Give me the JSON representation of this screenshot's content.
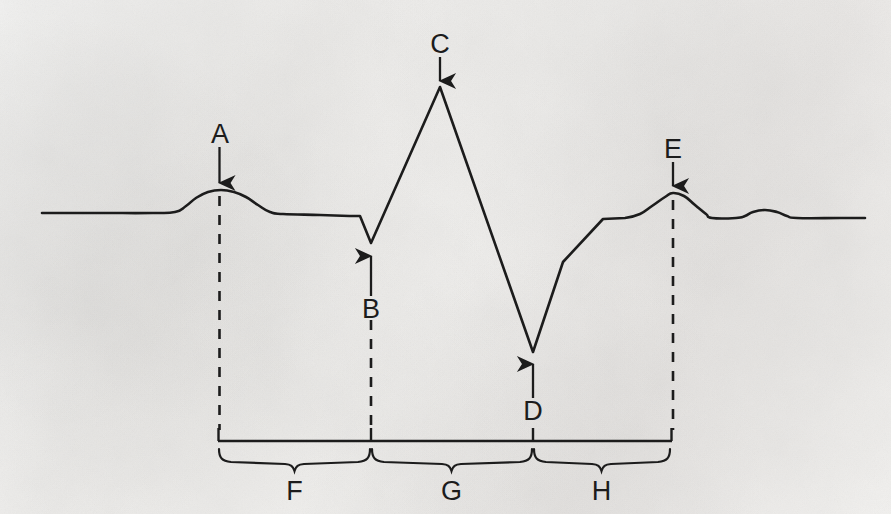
{
  "figure": {
    "kind": "ecg-waveform-labeled-diagram",
    "background_color": "#f3f2f0",
    "ink_color": "#1c1c1c",
    "width": 891,
    "height": 514
  },
  "labels": {
    "a": "A",
    "b": "B",
    "c": "C",
    "d": "D",
    "e": "E",
    "f": "F",
    "g": "G",
    "h": "H"
  },
  "chart_data": {
    "type": "line",
    "title": "",
    "xlabel": "",
    "ylabel": "",
    "grid": false,
    "legend": null,
    "series": [
      {
        "name": "ecg-trace",
        "points": [
          [
            42,
            213
          ],
          [
            100,
            213
          ],
          [
            152,
            213
          ],
          [
            175,
            212
          ],
          [
            186,
            206
          ],
          [
            196,
            198
          ],
          [
            208,
            192
          ],
          [
            221,
            190
          ],
          [
            234,
            192
          ],
          [
            246,
            197
          ],
          [
            258,
            205
          ],
          [
            270,
            212
          ],
          [
            283,
            214
          ],
          [
            320,
            215
          ],
          [
            352,
            216
          ],
          [
            360,
            216
          ],
          [
            371,
            243
          ],
          [
            440,
            87
          ],
          [
            533,
            352
          ],
          [
            563,
            262
          ],
          [
            603,
            219
          ],
          [
            625,
            218
          ],
          [
            640,
            214
          ],
          [
            652,
            206
          ],
          [
            665,
            197
          ],
          [
            673,
            193
          ],
          [
            684,
            196
          ],
          [
            695,
            205
          ],
          [
            706,
            214
          ],
          [
            712,
            218
          ],
          [
            736,
            218
          ],
          [
            745,
            216
          ],
          [
            753,
            212
          ],
          [
            765,
            210
          ],
          [
            777,
            212
          ],
          [
            787,
            216
          ],
          [
            797,
            218
          ],
          [
            840,
            218
          ],
          [
            865,
            218
          ]
        ]
      }
    ],
    "annotations": [
      {
        "label": "A",
        "kind": "down-arrow-with-dashed-dropline",
        "label_x": 220,
        "label_y": 133,
        "arrow_from_y": 147,
        "arrow_to_y": 186,
        "target_x": 220,
        "target_y": 190,
        "dash_from_y": 196,
        "dash_to_y": 430
      },
      {
        "label": "B",
        "kind": "up-arrow-with-dashed-dropline",
        "label_x": 371,
        "label_y": 311,
        "arrow_from_y": 296,
        "arrow_to_y": 252,
        "target_x": 371,
        "target_y": 243,
        "dash_from_y": 320,
        "dash_to_y": 430
      },
      {
        "label": "C",
        "kind": "down-arrow",
        "label_x": 440,
        "label_y": 47,
        "arrow_from_y": 57,
        "arrow_to_y": 84,
        "target_x": 440,
        "target_y": 87
      },
      {
        "label": "D",
        "kind": "up-arrow",
        "label_x": 533,
        "label_y": 413,
        "arrow_from_y": 398,
        "arrow_to_y": 360,
        "target_x": 533,
        "target_y": 352
      },
      {
        "label": "E",
        "kind": "down-arrow-with-dashed-dropline",
        "label_x": 673,
        "label_y": 152,
        "arrow_from_y": 162,
        "arrow_to_y": 189,
        "target_x": 673,
        "target_y": 193,
        "dash_from_y": 200,
        "dash_to_y": 430
      },
      {
        "label": "F",
        "kind": "interval-brace",
        "from_x": 218,
        "to_x": 371,
        "label_x": 294,
        "label_y": 494
      },
      {
        "label": "G",
        "kind": "interval-brace",
        "from_x": 371,
        "to_x": 533,
        "label_x": 452,
        "label_y": 494
      },
      {
        "label": "H",
        "kind": "interval-brace",
        "from_x": 533,
        "to_x": 672,
        "label_x": 602,
        "label_y": 494
      }
    ],
    "axis_bar": {
      "from_x": 218,
      "to_x": 672,
      "y": 441,
      "tick_top_y": 428,
      "ticks_x": [
        218,
        371,
        533,
        672
      ]
    }
  }
}
